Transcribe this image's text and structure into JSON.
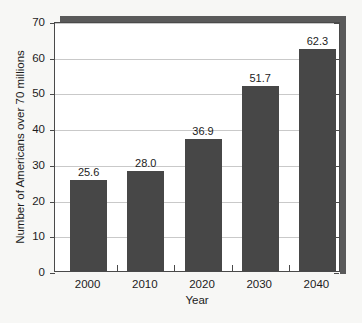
{
  "chart_data": {
    "type": "bar",
    "title": "",
    "xlabel": "Year",
    "ylabel": "Number of Americans over 70 millions",
    "categories": [
      "2000",
      "2010",
      "2020",
      "2030",
      "2040"
    ],
    "values": [
      25.6,
      28.0,
      36.9,
      51.7,
      62.3
    ],
    "data_labels": [
      "25.6",
      "28.0",
      "36.9",
      "51.7",
      "62.3"
    ],
    "ylim": [
      0,
      70
    ],
    "ytick_labels": [
      "0",
      "10",
      "20",
      "30",
      "40",
      "50",
      "60",
      "70"
    ],
    "ytick_values": [
      0,
      10,
      20,
      30,
      40,
      50,
      60,
      70
    ],
    "grid": true,
    "grid_axis": "y",
    "legend": false,
    "legend_position": "none",
    "bar_color": "#474747",
    "grid_color": "#c9c9c9",
    "axis_color": "#4a4a4a",
    "text_color": "#1c1c1c",
    "background_color": "#f7f7f5",
    "plot_background_color": "#ffffff",
    "shadow_color": "#5a5a5a"
  }
}
